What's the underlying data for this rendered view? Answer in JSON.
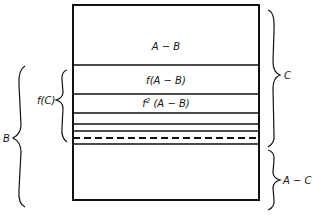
{
  "diagram": {
    "regions": [
      {
        "id": "a-minus-b",
        "label": "A − B"
      },
      {
        "id": "f-a-minus-b",
        "label": "f(A − B)"
      },
      {
        "id": "f2-a-minus-b",
        "label_prefix": "f",
        "label_sup": "2",
        "label_suffix": "(A − B)"
      }
    ],
    "braces": {
      "c": {
        "label": "C"
      },
      "a_minus_c": {
        "label": "A − C"
      },
      "f_c": {
        "label": "f(C)"
      },
      "b": {
        "label": "B"
      }
    },
    "colors": {
      "stroke": "#111111",
      "background": "#ffffff"
    }
  }
}
